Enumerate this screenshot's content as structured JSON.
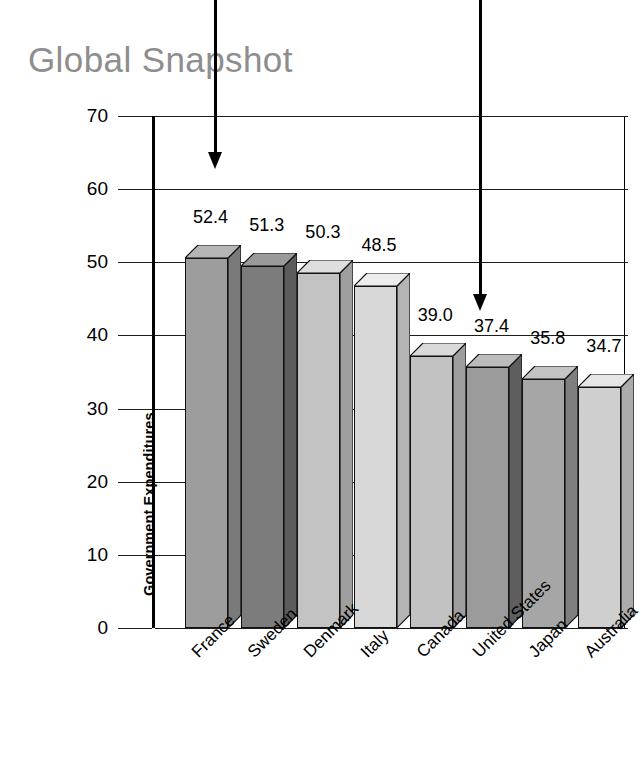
{
  "title": "Global Snapshot",
  "chart_data": {
    "type": "bar",
    "title": "Global Snapshot",
    "xlabel": "",
    "ylabel": "Government Expenditures as Percentage of Gross Domestic Product",
    "ylabel_line1": "Government Expenditures",
    "ylabel_line2": "as Percentage of Gross Domestic Product",
    "ylim": [
      0,
      70
    ],
    "yticks": [
      0,
      10,
      20,
      30,
      40,
      50,
      60,
      70
    ],
    "ytick_labels": [
      "0",
      "10",
      "20",
      "30",
      "40",
      "50",
      "60",
      "70"
    ],
    "grid": true,
    "legend": "none",
    "categories": [
      "France",
      "Sweden",
      "Denmark",
      "Italy",
      "Canada",
      "United States",
      "Japan",
      "Australia"
    ],
    "values": [
      52.4,
      51.3,
      50.3,
      48.5,
      39.0,
      37.4,
      35.8,
      34.7
    ],
    "value_labels": [
      "52.4",
      "51.3",
      "50.3",
      "48.5",
      "39.0",
      "37.4",
      "35.8",
      "34.7"
    ],
    "bar_colors": [
      "#9d9d9d",
      "#7c7c7c",
      "#c3c3c3",
      "#d8d8d8",
      "#c2c2c2",
      "#9b9b9b",
      "#a6a6a6",
      "#cfcfcf"
    ],
    "bar_side_colors": [
      "#7a7a7a",
      "#5c5c5c",
      "#9f9f9f",
      "#b4b4b4",
      "#9e9e9e",
      "#5e5e5e",
      "#7f7f7f",
      "#ababab"
    ],
    "bar_top_colors": [
      "#b6b6b6",
      "#9a9a9a",
      "#dedede",
      "#ededed",
      "#dadada",
      "#bcbcbc",
      "#c4c4c4",
      "#e6e6e6"
    ]
  },
  "annotations": [
    {
      "name": "annotation-arrow-france",
      "label": ""
    },
    {
      "name": "annotation-arrow-united-states",
      "label": ""
    }
  ],
  "colors": {
    "title": "#8e8e8e",
    "axis": "#000000",
    "grid": "#1d1d1d",
    "background": "#ffffff"
  }
}
